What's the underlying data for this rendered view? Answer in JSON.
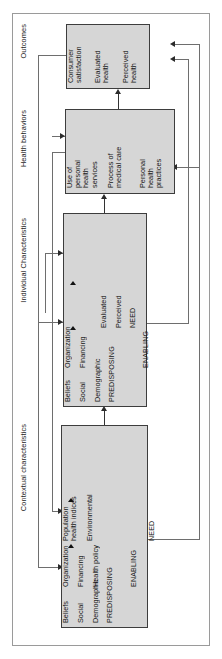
{
  "diagram": {
    "orientation": "rotated-90-ccw",
    "sections": [
      {
        "id": "contextual",
        "label": "Contextual characteristics"
      },
      {
        "id": "individual",
        "label": "Individual Characteristics"
      },
      {
        "id": "behaviors",
        "label": "Health behaviors"
      },
      {
        "id": "outcomes",
        "label": "Outcomes"
      }
    ],
    "boxes": {
      "contextual": {
        "name": "contextual-characteristics-box",
        "groups": [
          {
            "head": "PREDISPOSING",
            "items": [
              "Demographic",
              "Social",
              "Beliefs"
            ]
          },
          {
            "head": "ENABLING",
            "items": [
              "Health policy",
              "Financing",
              "Organization"
            ]
          },
          {
            "head": "NEED",
            "items": [
              "Environmental",
              "Population\nhealth indices"
            ]
          }
        ]
      },
      "individual": {
        "name": "individual-characteristics-box",
        "groups": [
          {
            "head": "PREDISPOSING",
            "items": [
              "Demographic",
              "Social",
              "Beliefs"
            ]
          },
          {
            "head": "ENABLING",
            "items": [
              "Financing",
              "Organization"
            ]
          },
          {
            "head": "NEED",
            "items": [
              "Perceived",
              "Evaluated"
            ]
          }
        ]
      },
      "behaviors": {
        "name": "health-behaviors-box",
        "groups": [
          {
            "head": "",
            "items": [
              "Personal\nhealth\npractices"
            ]
          },
          {
            "head": "",
            "items": [
              "Process of\nmedical care"
            ]
          },
          {
            "head": "",
            "items": [
              "Use of\npersonal\nhealth\nservices"
            ]
          }
        ]
      },
      "outcomes": {
        "name": "outcomes-box",
        "groups": [
          {
            "head": "",
            "items": [
              "Perceived\nhealth"
            ]
          },
          {
            "head": "",
            "items": [
              "Evaluated\nhealth"
            ]
          },
          {
            "head": "",
            "items": [
              "Consumer\nsatisfaction"
            ]
          }
        ]
      }
    },
    "colors": {
      "box_fill": "#d6d6d6",
      "box_border": "#3d3d3d",
      "connector": "#6e6e6e",
      "frame": "#9a9a9a",
      "text": "#1a1a1a",
      "background": "#ffffff"
    },
    "flow": [
      "Contextual characteristics -> Individual Characteristics",
      "Individual Characteristics -> Health behaviors",
      "Health behaviors -> Outcomes",
      "Outcomes -> Health behaviors (feedback)",
      "Outcomes -> Individual Characteristics (feedback)",
      "Outcomes -> Contextual characteristics (feedback)",
      "Health behaviors -> Individual Characteristics (feedback)",
      "Health behaviors -> Contextual characteristics (feedback)"
    ]
  }
}
